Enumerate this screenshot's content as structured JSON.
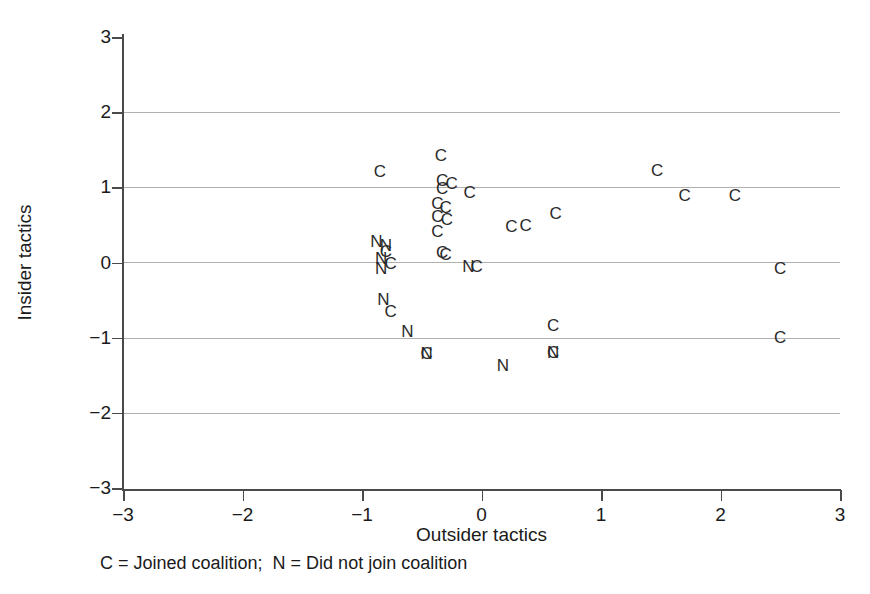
{
  "figure": {
    "caption": "C = Joined coalition;  N = Did not join coalition",
    "axis_title_x": "Outsider tactics",
    "axis_title_y": "Insider tactics"
  },
  "chart_data": {
    "type": "scatter",
    "title": "",
    "xlabel": "Outsider tactics",
    "ylabel": "Insider tactics",
    "xlim": [
      -3,
      3
    ],
    "ylim": [
      -3,
      3
    ],
    "xticks": [
      "-3",
      "-2",
      "-1",
      "0",
      "1",
      "2",
      "3"
    ],
    "xtick_values": [
      -3,
      -2,
      -1,
      0,
      1,
      2,
      3
    ],
    "yticks": [
      "3",
      "2",
      "1",
      "0",
      "-1",
      "-2",
      "-3"
    ],
    "ytick_values": [
      3,
      2,
      1,
      0,
      -1,
      -2,
      -3
    ],
    "grid": true,
    "gridlines_y": [
      2,
      1,
      0,
      -1,
      -2
    ],
    "legend": "C = Joined coalition;  N = Did not join coalition",
    "legend_position": "below-axis",
    "marker_type": "text-letter",
    "series": [
      {
        "name": "C = Joined coalition",
        "label": "C",
        "points": [
          [
            -0.85,
            1.2
          ],
          [
            -0.34,
            1.42
          ],
          [
            -0.33,
            1.08
          ],
          [
            -0.25,
            1.04
          ],
          [
            -0.33,
            0.98
          ],
          [
            -0.1,
            0.92
          ],
          [
            -0.37,
            0.78
          ],
          [
            -0.3,
            0.72
          ],
          [
            -0.37,
            0.6
          ],
          [
            -0.29,
            0.56
          ],
          [
            -0.37,
            0.4
          ],
          [
            -0.33,
            0.13
          ],
          [
            -0.3,
            0.1
          ],
          [
            -0.04,
            -0.06
          ],
          [
            -0.8,
            0.14
          ],
          [
            -0.76,
            -0.02
          ],
          [
            -0.76,
            -0.66
          ],
          [
            0.25,
            0.47
          ],
          [
            0.37,
            0.48
          ],
          [
            0.62,
            0.64
          ],
          [
            1.47,
            1.22
          ],
          [
            1.7,
            0.89
          ],
          [
            2.12,
            0.88
          ],
          [
            2.5,
            -0.08
          ],
          [
            2.5,
            -1.0
          ],
          [
            0.6,
            -0.84
          ],
          [
            -0.46,
            -1.22
          ],
          [
            0.6,
            -1.2
          ]
        ]
      },
      {
        "name": "N = Did not join coalition",
        "label": "N",
        "points": [
          [
            -0.88,
            0.27
          ],
          [
            -0.8,
            0.22
          ],
          [
            -0.84,
            0.05
          ],
          [
            -0.84,
            -0.08
          ],
          [
            -0.82,
            -0.5
          ],
          [
            -0.62,
            -0.92
          ],
          [
            -0.46,
            -1.22
          ],
          [
            -0.11,
            -0.06
          ],
          [
            0.6,
            -1.2
          ],
          [
            0.18,
            -1.38
          ]
        ]
      }
    ]
  }
}
